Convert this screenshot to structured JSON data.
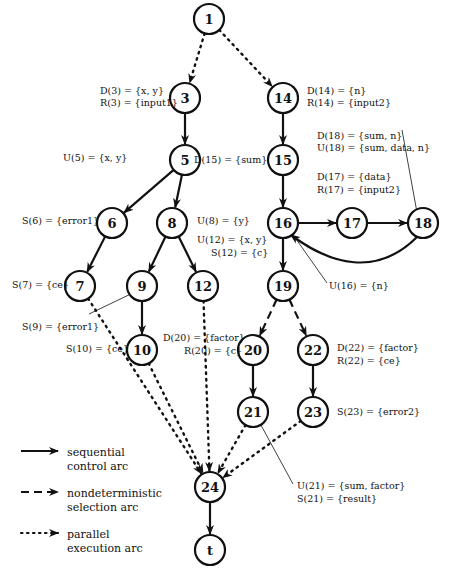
{
  "nodes": [
    {
      "id": "1",
      "label": "1",
      "x": 209,
      "y": 19
    },
    {
      "id": "3",
      "label": "3",
      "x": 185,
      "y": 98
    },
    {
      "id": "14",
      "label": "14",
      "x": 283,
      "y": 98
    },
    {
      "id": "5",
      "label": "5",
      "x": 185,
      "y": 160
    },
    {
      "id": "15",
      "label": "15",
      "x": 283,
      "y": 160
    },
    {
      "id": "6",
      "label": "6",
      "x": 112,
      "y": 223
    },
    {
      "id": "8",
      "label": "8",
      "x": 172,
      "y": 223
    },
    {
      "id": "16",
      "label": "16",
      "x": 283,
      "y": 223
    },
    {
      "id": "17",
      "label": "17",
      "x": 352,
      "y": 223
    },
    {
      "id": "18",
      "label": "18",
      "x": 423,
      "y": 223
    },
    {
      "id": "7",
      "label": "7",
      "x": 80,
      "y": 286
    },
    {
      "id": "9",
      "label": "9",
      "x": 142,
      "y": 286
    },
    {
      "id": "12",
      "label": "12",
      "x": 203,
      "y": 286
    },
    {
      "id": "19",
      "label": "19",
      "x": 283,
      "y": 286
    },
    {
      "id": "10",
      "label": "10",
      "x": 142,
      "y": 350
    },
    {
      "id": "20",
      "label": "20",
      "x": 253,
      "y": 350
    },
    {
      "id": "22",
      "label": "22",
      "x": 313,
      "y": 350
    },
    {
      "id": "21",
      "label": "21",
      "x": 253,
      "y": 412
    },
    {
      "id": "23",
      "label": "23",
      "x": 313,
      "y": 412
    },
    {
      "id": "24",
      "label": "24",
      "x": 210,
      "y": 487
    },
    {
      "id": "t",
      "label": "t",
      "x": 210,
      "y": 550
    }
  ],
  "edges": [
    {
      "from": "1",
      "to": "3",
      "type": "parallel"
    },
    {
      "from": "1",
      "to": "14",
      "type": "parallel"
    },
    {
      "from": "3",
      "to": "5",
      "type": "sequential"
    },
    {
      "from": "14",
      "to": "15",
      "type": "sequential"
    },
    {
      "from": "5",
      "to": "6",
      "type": "sequential"
    },
    {
      "from": "5",
      "to": "8",
      "type": "sequential"
    },
    {
      "from": "15",
      "to": "16",
      "type": "sequential"
    },
    {
      "from": "16",
      "to": "17",
      "type": "sequential"
    },
    {
      "from": "17",
      "to": "18",
      "type": "sequential"
    },
    {
      "from": "18",
      "to": "16",
      "type": "sequential",
      "curved": true
    },
    {
      "from": "6",
      "to": "7",
      "type": "sequential"
    },
    {
      "from": "8",
      "to": "9",
      "type": "sequential"
    },
    {
      "from": "8",
      "to": "12",
      "type": "sequential"
    },
    {
      "from": "16",
      "to": "19",
      "type": "sequential"
    },
    {
      "from": "9",
      "to": "10",
      "type": "sequential"
    },
    {
      "from": "19",
      "to": "20",
      "type": "nondeterministic"
    },
    {
      "from": "19",
      "to": "22",
      "type": "nondeterministic"
    },
    {
      "from": "20",
      "to": "21",
      "type": "sequential"
    },
    {
      "from": "22",
      "to": "23",
      "type": "sequential"
    },
    {
      "from": "7",
      "to": "24",
      "type": "parallel"
    },
    {
      "from": "10",
      "to": "24",
      "type": "parallel"
    },
    {
      "from": "12",
      "to": "24",
      "type": "parallel"
    },
    {
      "from": "21",
      "to": "24",
      "type": "parallel"
    },
    {
      "from": "23",
      "to": "24",
      "type": "parallel"
    },
    {
      "from": "24",
      "to": "t",
      "type": "sequential"
    }
  ],
  "annotations": {
    "d3": "D(3) = {x, y}",
    "r3": "R(3) = {input1}",
    "d14": "D(14) = {n}",
    "r14": "R(14) = {input2}",
    "d18": "D(18) = {sum, n}",
    "u18": "U(18) = {sum, data, n}",
    "u5": "U(5) = {x, y}",
    "d15": "D(15) = {sum}",
    "d17": "D(17) = {data}",
    "r17": "R(17) = {input2}",
    "s6": "S(6) = {error1}",
    "u8": "U(8) = {y}",
    "u12": "U(12) = {x, y}",
    "s12": "S(12) = {c}",
    "s7": "S(7) = {ce}",
    "u16": "U(16) = {n}",
    "s9": "S(9) = {error1}",
    "s10": "S(10) = {ce}",
    "d20": "D(20) = {factor}",
    "r20": "R(20) = {c}",
    "d22": "D(22) = {factor}",
    "r22": "R(22) = {ce}",
    "s23": "S(23) = {error2}",
    "u21": "U(21) = {sum, factor}",
    "s21": "S(21) = {result}"
  },
  "legend": {
    "sequential": {
      "line1": "sequential",
      "line2": "control arc"
    },
    "nondeterministic": {
      "line1": "nondeterministic",
      "line2": "selection arc"
    },
    "parallel": {
      "line1": "parallel",
      "line2": "execution arc"
    }
  },
  "colors": {
    "stroke": "#111111",
    "background": "#ffffff"
  }
}
